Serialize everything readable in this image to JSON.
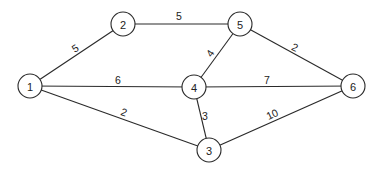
{
  "diagram": {
    "type": "weighted-undirected-graph",
    "nodes": [
      {
        "id": "1",
        "label": "1",
        "x": 30,
        "y": 86
      },
      {
        "id": "2",
        "label": "2",
        "x": 123,
        "y": 24
      },
      {
        "id": "5",
        "label": "5",
        "x": 240,
        "y": 24
      },
      {
        "id": "4",
        "label": "4",
        "x": 194,
        "y": 87
      },
      {
        "id": "6",
        "label": "6",
        "x": 353,
        "y": 86
      },
      {
        "id": "3",
        "label": "3",
        "x": 209,
        "y": 150
      }
    ],
    "edges": [
      {
        "from": "1",
        "to": "2",
        "weight": "5",
        "lx": 75,
        "ly": 48,
        "rot": -33
      },
      {
        "from": "2",
        "to": "5",
        "weight": "5",
        "lx": 179,
        "ly": 16,
        "rot": 0
      },
      {
        "from": "1",
        "to": "4",
        "weight": "6",
        "lx": 118,
        "ly": 80,
        "rot": 0
      },
      {
        "from": "1",
        "to": "3",
        "weight": "2",
        "lx": 124,
        "ly": 112,
        "rot": 19
      },
      {
        "from": "5",
        "to": "4",
        "weight": "4",
        "lx": 210,
        "ly": 53,
        "rot": -55
      },
      {
        "from": "5",
        "to": "6",
        "weight": "2",
        "lx": 295,
        "ly": 47,
        "rot": 24
      },
      {
        "from": "4",
        "to": "6",
        "weight": "7",
        "lx": 267,
        "ly": 80,
        "rot": 0
      },
      {
        "from": "4",
        "to": "3",
        "weight": "3",
        "lx": 205,
        "ly": 116,
        "rot": 0
      },
      {
        "from": "3",
        "to": "6",
        "weight": "10",
        "lx": 272,
        "ly": 114,
        "rot": -25
      }
    ]
  }
}
